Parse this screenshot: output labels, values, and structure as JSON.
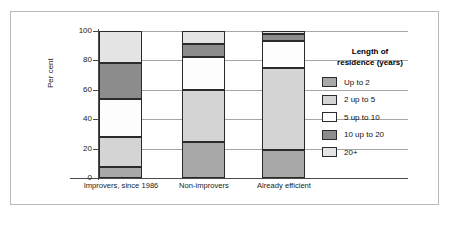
{
  "chart_data": {
    "type": "bar",
    "subtype": "stacked-100-percent",
    "title": "",
    "xlabel": "",
    "ylabel": "Per cent",
    "ylim": [
      0,
      100
    ],
    "yticks": [
      0,
      20,
      40,
      60,
      80,
      100
    ],
    "grid": true,
    "legend_position": "right",
    "legend_title": "Length of\nresidence (years)",
    "legend_title_line1": "Length of",
    "legend_title_line2": "residence (years)",
    "categories": [
      "Improvers, since 1986",
      "Non-improvers",
      "Already efficient"
    ],
    "series": [
      {
        "name": "Up to 2",
        "color": "#a8a8a8",
        "values": [
          7.5,
          24.5,
          19
        ]
      },
      {
        "name": "2 up to 5",
        "color": "#d4d4d4",
        "values": [
          20.5,
          35.5,
          56
        ]
      },
      {
        "name": "5 up to 10",
        "color": "#fdfdfd",
        "values": [
          26,
          22,
          18
        ]
      },
      {
        "name": "10 up to 20",
        "color": "#8c8c8c",
        "values": [
          24,
          9,
          5
        ]
      },
      {
        "name": "20+",
        "color": "#e4e4e4",
        "values": [
          22,
          9,
          2
        ]
      }
    ]
  },
  "axis": {
    "y_label": "Per cent",
    "ticks": [
      "100",
      "80",
      "60",
      "40",
      "20",
      "0"
    ]
  },
  "legend": {
    "title_line1": "Length of",
    "title_line2": "residence (years)",
    "items": [
      {
        "label": "Up to 2",
        "color": "#a8a8a8"
      },
      {
        "label": "2 up to 5",
        "color": "#d4d4d4"
      },
      {
        "label": "5 up to 10",
        "color": "#fdfdfd"
      },
      {
        "label": "10 up to 20",
        "color": "#8c8c8c"
      },
      {
        "label": "20+",
        "color": "#e4e4e4"
      }
    ]
  },
  "xaxis": {
    "labels": [
      "Improvers, since 1986",
      "Non-improvers",
      "Already efficient"
    ]
  }
}
